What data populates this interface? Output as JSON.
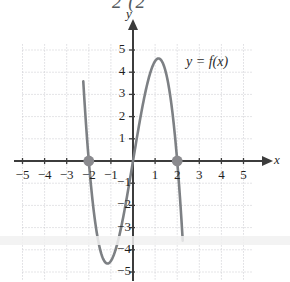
{
  "figure": {
    "kind": "cartesian-graph",
    "cropped_top_text": "2    (2",
    "curve_label": "y = f(x)",
    "axis_x_name": "x",
    "axis_y_name": "y",
    "colors": {
      "curve": "#7d8084",
      "axis": "#3c3c3c",
      "grid": "#c9c9cf",
      "point": "#8a8a8e",
      "label": "#1f1f1f",
      "background": "#ffffff"
    }
  },
  "chart_data": {
    "type": "line",
    "title": "",
    "xlabel": "x",
    "ylabel": "y",
    "xlim": [
      -5.6,
      5.9
    ],
    "ylim": [
      -5.4,
      5.6
    ],
    "grid": true,
    "legend": "none",
    "x_ticks": [
      -5,
      -4,
      -3,
      -2,
      -1,
      1,
      2,
      3,
      4,
      5
    ],
    "y_ticks": [
      5,
      4,
      3,
      2,
      1,
      -1,
      -2,
      -3,
      -4,
      -5
    ],
    "x_tick_labels": [
      "-5",
      "-4",
      "-3",
      "-2",
      "-1",
      "1",
      "2",
      "3",
      "4",
      "5"
    ],
    "y_tick_labels": [
      "5",
      "4",
      "3",
      "2",
      "1",
      "-1",
      "-2",
      "-3",
      "-4",
      "-5"
    ],
    "annotations": [
      {
        "text": "y = f(x)",
        "x": 2.6,
        "y": 4.05
      }
    ],
    "marked_points": [
      {
        "x": -2,
        "y": 0,
        "style": "filled-circle"
      },
      {
        "x": 2,
        "y": 0,
        "style": "filled-circle"
      }
    ],
    "features": {
      "roots": [
        -2,
        0,
        2
      ],
      "local_minimum": {
        "x": -1,
        "y": -4
      },
      "local_maximum": {
        "x": 1,
        "y": 4
      },
      "domain_drawn": [
        -2.25,
        2.25
      ]
    },
    "series": [
      {
        "name": "f",
        "points": [
          [
            -2.25,
            2.06
          ],
          [
            -2.2,
            1.42
          ],
          [
            -2.15,
            0.82
          ],
          [
            -2.1,
            0.25
          ],
          [
            -2.05,
            -0.28
          ],
          [
            -2.0,
            -0.78
          ],
          [
            -1.95,
            -1.25
          ],
          [
            -1.9,
            -1.68
          ],
          [
            -1.85,
            -2.08
          ],
          [
            -1.8,
            -2.45
          ],
          [
            -1.75,
            -2.79
          ],
          [
            -1.7,
            -3.09
          ],
          [
            -1.65,
            -3.37
          ],
          [
            -1.6,
            -3.61
          ],
          [
            -1.55,
            -3.82
          ],
          [
            -1.5,
            -4.0
          ],
          [
            -1.45,
            -4.15
          ],
          [
            -1.4,
            -4.27
          ],
          [
            -1.35,
            -4.36
          ],
          [
            -1.3,
            -4.42
          ],
          [
            -1.25,
            -4.45
          ],
          [
            -1.2,
            -4.45
          ],
          [
            -1.15,
            -4.43
          ],
          [
            -1.1,
            -4.37
          ],
          [
            -1.05,
            -4.29
          ],
          [
            -1.0,
            -4.18
          ],
          [
            -0.95,
            -4.04
          ],
          [
            -0.9,
            -3.87
          ],
          [
            -0.85,
            -3.68
          ],
          [
            -0.8,
            -3.46
          ],
          [
            -0.75,
            -3.22
          ],
          [
            -0.7,
            -2.95
          ],
          [
            -0.65,
            -2.66
          ],
          [
            -0.6,
            -2.34
          ],
          [
            -0.55,
            -2.0
          ],
          [
            -0.5,
            -1.63
          ],
          [
            -0.45,
            -1.24
          ],
          [
            -0.4,
            -0.82
          ],
          [
            -0.35,
            -0.38
          ],
          [
            -0.3,
            0.08
          ],
          [
            -0.25,
            0.57
          ],
          [
            -0.2,
            1.08
          ],
          [
            -0.15,
            1.62
          ],
          [
            -0.1,
            2.18
          ],
          [
            -0.05,
            2.76
          ],
          [
            0.0,
            3.37
          ]
        ],
        "note": "sampled positions are figure-space; rendering uses the cubic form below"
      }
    ],
    "function_form": {
      "expression": "f(x) = -3x^3 + ... cubic with roots -2, 0, 2",
      "simplified": "f(x) = -x^3 + 4x scaled so max(1)=4, min(-1)=-4",
      "used_for_render": "y = -1.5*x*(x*x-4)"
    }
  }
}
